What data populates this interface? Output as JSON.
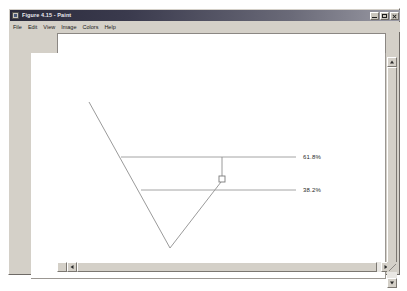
{
  "window": {
    "title": "Figure 4.15 - Paint",
    "icon": "paint-app-icon",
    "buttons": {
      "minimize": "minimize-icon",
      "maximize": "maximize-icon",
      "close": "close-icon"
    }
  },
  "menubar": {
    "items": [
      {
        "label": "File"
      },
      {
        "label": "Edit"
      },
      {
        "label": "View"
      },
      {
        "label": "Image"
      },
      {
        "label": "Colors"
      },
      {
        "label": "Help"
      }
    ]
  },
  "scrollbars": {
    "vertical": {
      "up": "scroll-up-arrow-icon",
      "down": "scroll-down-arrow-icon"
    },
    "horizontal": {
      "left": "scroll-left-arrow-icon",
      "right": "scroll-right-arrow-icon"
    }
  },
  "chart_data": {
    "type": "line",
    "title": "Figure 4.15",
    "xlabel": "",
    "ylabel": "",
    "grid": false,
    "legend_position": "right",
    "xlim": [
      0,
      355
    ],
    "ylim": [
      0,
      226
    ],
    "annotations": [
      {
        "name": "fib-level-618",
        "label": "61.8%",
        "x": 272,
        "y": 104
      },
      {
        "name": "fib-level-382",
        "label": "38.2%",
        "x": 272,
        "y": 137
      }
    ],
    "series": [
      {
        "name": "downtrend-leg",
        "points": [
          [
            58,
            49
          ],
          [
            139,
            195
          ]
        ],
        "color": "#8f8f8f"
      },
      {
        "name": "recovery-leg",
        "points": [
          [
            139,
            195
          ],
          [
            190,
            129
          ]
        ],
        "color": "#8f8f8f"
      },
      {
        "name": "fib-line-618",
        "points": [
          [
            90,
            104
          ],
          [
            265,
            104
          ]
        ],
        "color": "#9a9a9a"
      },
      {
        "name": "fib-line-382",
        "points": [
          [
            110,
            137
          ],
          [
            265,
            137
          ]
        ],
        "color": "#9a9a9a"
      },
      {
        "name": "marker-stem",
        "points": [
          [
            191,
            104
          ],
          [
            191,
            123
          ]
        ],
        "color": "#8f8f8f"
      }
    ],
    "markers": [
      {
        "name": "square-handle",
        "x": 191,
        "y": 126,
        "size": 6,
        "filled": false,
        "color": "#7a7a7a"
      }
    ]
  }
}
